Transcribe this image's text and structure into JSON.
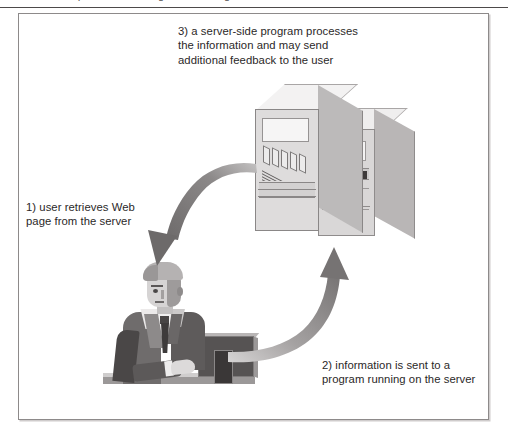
{
  "page": {
    "clipped_header_text": "Chapter 1  •  Web Page Processing",
    "figure_background": "#ffffff",
    "frame_border_color": "#8d8a8a"
  },
  "figure": {
    "captions": [
      {
        "id": "caption-3",
        "step": "3",
        "text": "3) a server-side program processes\nthe information and may send\nadditional feedback to the user"
      },
      {
        "id": "caption-1",
        "step": "1",
        "text": "1) user retrieves Web\npage from the server"
      },
      {
        "id": "caption-2",
        "step": "2",
        "text": "2) information is sent to a\nprogram running on the server"
      }
    ],
    "illustrations": {
      "servers_label": "two server towers",
      "user_label": "businessman at desktop computer"
    },
    "arrows": [
      {
        "id": "arrow-server-to-user",
        "description": "curved arrow from servers down to user",
        "direction": "down-left",
        "color": "#7a7777"
      },
      {
        "id": "arrow-user-to-server",
        "description": "curved arrow from user up to servers",
        "direction": "up-right",
        "color": "#8c8989"
      }
    ],
    "colors": {
      "arrow_dark": "#6f6c6c",
      "arrow_light": "#b3b0b0",
      "server_front": "#dedcdc",
      "server_side": "#bcbaba",
      "server_top": "#f3f2f2",
      "suit": "#6f6c6c",
      "monitor": "#565353",
      "text": "#2b2828"
    }
  }
}
